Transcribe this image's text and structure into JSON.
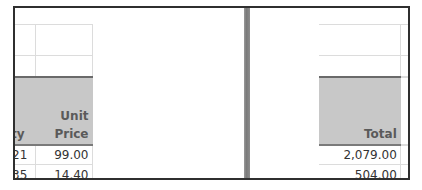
{
  "left_pane": {
    "columns": [
      {
        "key": "qty",
        "header_line1": "",
        "header_line2": "ty"
      },
      {
        "key": "unit_price",
        "header_line1": "Unit",
        "header_line2": "Price"
      }
    ],
    "rows": [
      {
        "qty": "21",
        "unit_price": "99.00"
      },
      {
        "qty": "35",
        "unit_price": "14.40"
      }
    ]
  },
  "right_pane": {
    "columns": [
      {
        "key": "total",
        "header_line1": "",
        "header_line2": "Total"
      }
    ],
    "rows": [
      {
        "total": "2,079.00"
      },
      {
        "total": "504.00"
      }
    ]
  },
  "colors": {
    "header_fill": "#c8c8c8",
    "header_text": "#5a5a5a",
    "gridline": "#dcdcdc",
    "frame_border": "#2f2f2f",
    "split_bar": "#8a8a8a"
  }
}
